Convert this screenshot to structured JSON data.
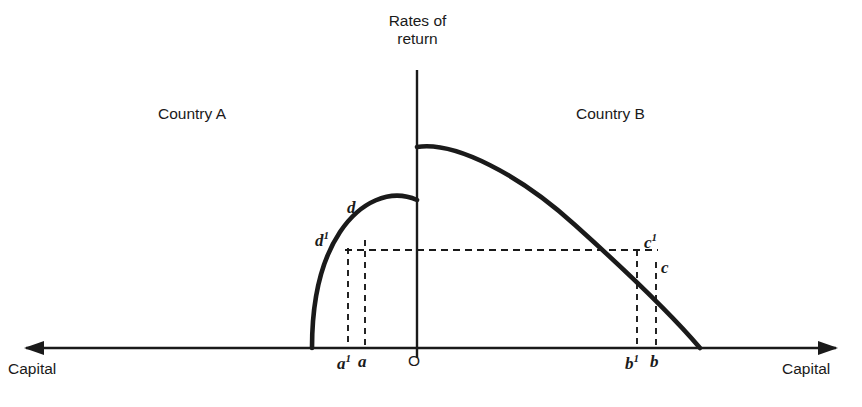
{
  "figure": {
    "kind": "diagram",
    "type": "economics-capital-flow-diagram",
    "background_color": "#ffffff",
    "line_color": "#1a1a1a",
    "axes": {
      "vertical_axis_title": "Rates of\nreturn",
      "vertical_axis_title_line1": "Rates of",
      "vertical_axis_title_line2": "return",
      "origin_label": "O",
      "horizontal_axis_label_left": "Capital",
      "horizontal_axis_label_right": "Capital",
      "horizontal_axis_y": 348,
      "vertical_axis_x": 417,
      "vertical_axis_top_y": 70,
      "left_arrow_x": 24,
      "right_arrow_x": 838
    },
    "regions": [
      {
        "name": "Country A",
        "label": "Country A",
        "side": "left"
      },
      {
        "name": "Country B",
        "label": "Country B",
        "side": "right"
      }
    ],
    "curves": [
      {
        "name": "country-a-return-curve",
        "side": "left",
        "axis_intercept_x": 312,
        "axis_intercept_y": 348,
        "vertical_axis_meet_y": 200
      },
      {
        "name": "country-b-return-curve",
        "side": "right",
        "vertical_axis_meet_y": 147,
        "peak_x": 432,
        "peak_y": 145,
        "axis_intercept_x": 700,
        "axis_intercept_y": 348
      }
    ],
    "common_return_line": {
      "name": "equalized-rate-of-return-line",
      "y": 250,
      "x_start": 348,
      "x_end": 656,
      "style": "dashed"
    },
    "points": [
      {
        "label": "d",
        "superscript": "",
        "x": 365,
        "y": 250,
        "side": "left",
        "label_x": 347,
        "label_y": 198
      },
      {
        "label": "d",
        "superscript": "1",
        "x": 348,
        "y": 250,
        "side": "left",
        "label_x": 315,
        "label_y": 229
      },
      {
        "label": "c",
        "superscript": "1",
        "x": 637,
        "y": 250,
        "side": "right",
        "label_x": 644,
        "label_y": 231
      },
      {
        "label": "c",
        "superscript": "",
        "x": 656,
        "y": 250,
        "side": "right",
        "label_x": 661,
        "label_y": 258
      }
    ],
    "axis_ticks": [
      {
        "label": "a",
        "superscript": "1",
        "x": 348,
        "label_x": 337
      },
      {
        "label": "a",
        "superscript": "",
        "x": 365,
        "label_x": 358
      },
      {
        "label": "b",
        "superscript": "1",
        "x": 637,
        "label_x": 625
      },
      {
        "label": "b",
        "superscript": "",
        "x": 656,
        "label_x": 650
      }
    ],
    "drop_lines": [
      {
        "name": "drop-line-a1",
        "x": 348,
        "y_top": 250,
        "y_bottom": 348,
        "style": "dashed"
      },
      {
        "name": "drop-line-a",
        "x": 365,
        "y_top": 250,
        "y_bottom": 348,
        "style": "dashed"
      },
      {
        "name": "drop-line-b1",
        "x": 637,
        "y_top": 250,
        "y_bottom": 348,
        "style": "dashed"
      },
      {
        "name": "drop-line-b",
        "x": 656,
        "y_top": 250,
        "y_bottom": 348,
        "style": "dashed"
      }
    ]
  }
}
